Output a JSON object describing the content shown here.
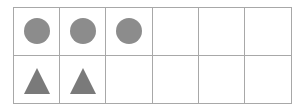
{
  "ten_frame": {
    "columns": 6,
    "rows": 2,
    "row_contents": [
      [
        "circle",
        "circle",
        "circle",
        "empty",
        "empty",
        "empty"
      ],
      [
        "triangle",
        "triangle",
        "empty",
        "empty",
        "empty",
        "empty"
      ]
    ],
    "counts": {
      "circles": 3,
      "triangles": 2
    },
    "colors": {
      "grid_line": "#a8a8a8",
      "circle": "#8c8c8c",
      "triangle": "#7a7a7a"
    }
  }
}
